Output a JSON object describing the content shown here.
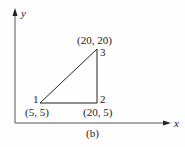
{
  "diagram": {
    "caption": "(b)",
    "axes": {
      "x_label": "x",
      "y_label": "y"
    },
    "nodes": [
      {
        "id": "1",
        "label": "1",
        "coord_label": "(5, 5)",
        "x": 5,
        "y": 5
      },
      {
        "id": "2",
        "label": "2",
        "coord_label": "(20, 5)",
        "x": 20,
        "y": 5
      },
      {
        "id": "3",
        "label": "3",
        "coord_label": "(20, 20)",
        "x": 20,
        "y": 20
      }
    ],
    "edges": [
      {
        "from": "1",
        "to": "2"
      },
      {
        "from": "2",
        "to": "3"
      },
      {
        "from": "3",
        "to": "1"
      }
    ],
    "colors": {
      "line": "#222222",
      "axis": "#555555"
    }
  }
}
